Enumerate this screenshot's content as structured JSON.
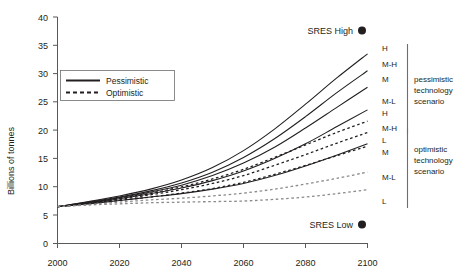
{
  "chart_data": {
    "type": "line",
    "title": "",
    "xlabel": "",
    "ylabel": "Billions of tonnes",
    "xlim": [
      2000,
      2100
    ],
    "ylim": [
      0,
      40
    ],
    "xticks": [
      2000,
      2020,
      2040,
      2060,
      2080,
      2100
    ],
    "xtick_labels": [
      "2000",
      "2020",
      "2040",
      "2060",
      "2080",
      "2100"
    ],
    "yticks": [
      0,
      5,
      10,
      15,
      20,
      25,
      30,
      35,
      40
    ],
    "ytick_labels": [
      "0",
      "5",
      "10",
      "15",
      "20",
      "25",
      "30",
      "35",
      "40"
    ],
    "grid": false,
    "legend_position": "upper-left",
    "x": [
      2000,
      2010,
      2020,
      2030,
      2040,
      2050,
      2060,
      2070,
      2080,
      2090,
      2100
    ],
    "series": [
      {
        "name": "Pessimistic H",
        "style": "solid",
        "label": "H",
        "group": "pessimistic technology scenario",
        "values": [
          6.5,
          7.4,
          8.4,
          9.6,
          11.2,
          13.4,
          16.4,
          20.2,
          24.6,
          29.2,
          33.5
        ]
      },
      {
        "name": "Pessimistic M-H",
        "style": "solid",
        "label": "M-H",
        "group": "pessimistic technology scenario",
        "values": [
          6.5,
          7.3,
          8.2,
          9.3,
          10.7,
          12.6,
          15.2,
          18.5,
          22.4,
          26.6,
          30.5
        ]
      },
      {
        "name": "Pessimistic M",
        "style": "solid",
        "label": "M",
        "group": "pessimistic technology scenario",
        "values": [
          6.5,
          7.2,
          8.1,
          9.1,
          10.3,
          12.0,
          14.2,
          17.0,
          20.4,
          24.0,
          27.6
        ]
      },
      {
        "name": "Pessimistic M-L",
        "style": "solid",
        "label": "M-L",
        "group": "pessimistic technology scenario",
        "values": [
          6.5,
          7.1,
          7.9,
          8.8,
          9.8,
          11.1,
          12.8,
          15.0,
          17.6,
          20.6,
          23.6
        ]
      },
      {
        "name": "Pessimistic L",
        "style": "solid",
        "label": "L",
        "group": "pessimistic technology scenario",
        "values": [
          6.5,
          7.0,
          7.6,
          8.2,
          8.8,
          9.6,
          10.6,
          12.0,
          13.7,
          15.6,
          17.6
        ]
      },
      {
        "name": "Optimistic H",
        "style": "dashed",
        "label": "H",
        "group": "optimistic technology scenario",
        "values": [
          6.5,
          7.2,
          8.0,
          8.9,
          10.0,
          11.4,
          13.1,
          15.2,
          17.4,
          19.6,
          21.6
        ]
      },
      {
        "name": "Optimistic M-H",
        "style": "dashed",
        "label": "M-H",
        "group": "optimistic technology scenario",
        "values": [
          6.5,
          7.1,
          7.8,
          8.6,
          9.5,
          10.6,
          12.0,
          13.8,
          15.7,
          17.7,
          19.6
        ]
      },
      {
        "name": "Optimistic M",
        "style": "dashed",
        "label": "M",
        "group": "optimistic technology scenario",
        "values": [
          6.5,
          7.0,
          7.6,
          8.2,
          8.9,
          9.7,
          10.8,
          12.2,
          13.8,
          15.5,
          17.2
        ]
      },
      {
        "name": "Optimistic M-L",
        "style": "dashed",
        "label": "M-L",
        "group": "optimistic technology scenario",
        "values": [
          6.5,
          6.9,
          7.3,
          7.7,
          8.0,
          8.4,
          8.9,
          9.6,
          10.5,
          11.5,
          12.6
        ]
      },
      {
        "name": "Optimistic L",
        "style": "dashed",
        "label": "L",
        "group": "optimistic technology scenario",
        "values": [
          6.5,
          6.8,
          7.0,
          7.2,
          7.3,
          7.4,
          7.5,
          7.8,
          8.2,
          8.8,
          9.5
        ]
      }
    ],
    "annotations": [
      {
        "name": "sres-high",
        "text": "SRES High",
        "x": 2100,
        "y": 36.5
      },
      {
        "name": "sres-low",
        "text": "SRES Low",
        "x": 2100,
        "y": 4.5
      }
    ]
  },
  "legend": {
    "items": [
      {
        "label": "Pessimistic",
        "style": "solid"
      },
      {
        "label": "Optimistic",
        "style": "dashed"
      }
    ]
  },
  "right_labels": {
    "curves": [
      "H",
      "M-H",
      "M",
      "M-L",
      "H",
      "M-H",
      "L",
      "M",
      "M-L",
      "L"
    ],
    "groups": [
      {
        "lines": [
          "pessimistic",
          "technology",
          "scenario"
        ]
      },
      {
        "lines": [
          "optimistic",
          "technology",
          "scenario"
        ]
      }
    ]
  },
  "axis": {
    "y_title": "Billions of tonnes"
  },
  "colors": {
    "ink": "#231f20",
    "axis": "#58595b",
    "faint": "#8a8a8a"
  }
}
